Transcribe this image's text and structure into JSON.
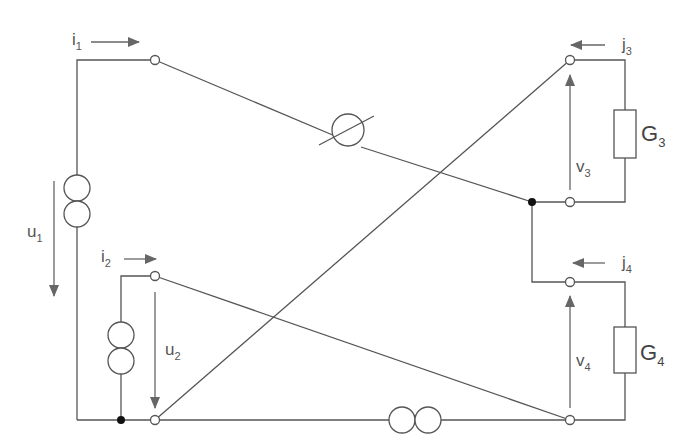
{
  "diagram": {
    "type": "electrical-circuit",
    "labels": {
      "i1": {
        "base": "i",
        "sub": "1"
      },
      "i2": {
        "base": "i",
        "sub": "2"
      },
      "j3": {
        "base": "j",
        "sub": "3"
      },
      "j4": {
        "base": "j",
        "sub": "4"
      },
      "u1": {
        "base": "u",
        "sub": "1"
      },
      "u2": {
        "base": "u",
        "sub": "2"
      },
      "v3": {
        "base": "v",
        "sub": "3"
      },
      "v4": {
        "base": "v",
        "sub": "4"
      },
      "G3": {
        "base": "G",
        "sub": "3"
      },
      "G4": {
        "base": "G",
        "sub": "4"
      }
    },
    "components": [
      {
        "id": "source-u1",
        "kind": "double-circle-source",
        "orientation": "vertical"
      },
      {
        "id": "source-u2",
        "kind": "double-circle-source",
        "orientation": "vertical"
      },
      {
        "id": "source-bottom",
        "kind": "double-circle-source",
        "orientation": "horizontal"
      },
      {
        "id": "variable-element",
        "kind": "circle-with-slash"
      },
      {
        "id": "resistor-G3",
        "kind": "resistor"
      },
      {
        "id": "resistor-G4",
        "kind": "resistor"
      }
    ],
    "colors": {
      "wire": "#555555",
      "arrow": "#666666",
      "background": "#ffffff"
    }
  }
}
